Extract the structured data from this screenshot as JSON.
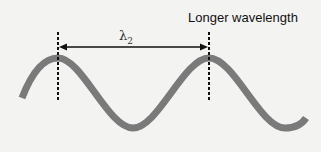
{
  "diagram": {
    "title": "Longer wavelength",
    "wavelength_symbol": "λ",
    "wavelength_subscript": "2",
    "colors": {
      "background": "#f3f3f1",
      "wave": "#7a7a7a",
      "arrow": "#111111",
      "dashed_lines": "#111111"
    },
    "wave": {
      "crests_x": [
        58,
        209
      ],
      "troughs_x": [
        133,
        285
      ],
      "crest_y": 58,
      "trough_y": 128
    },
    "markers": {
      "left_x": 58,
      "right_x": 209,
      "top_y": 32,
      "bottom_y": 102
    },
    "arrow": {
      "x1": 58,
      "x2": 209,
      "y": 47,
      "type": "double-headed"
    }
  }
}
